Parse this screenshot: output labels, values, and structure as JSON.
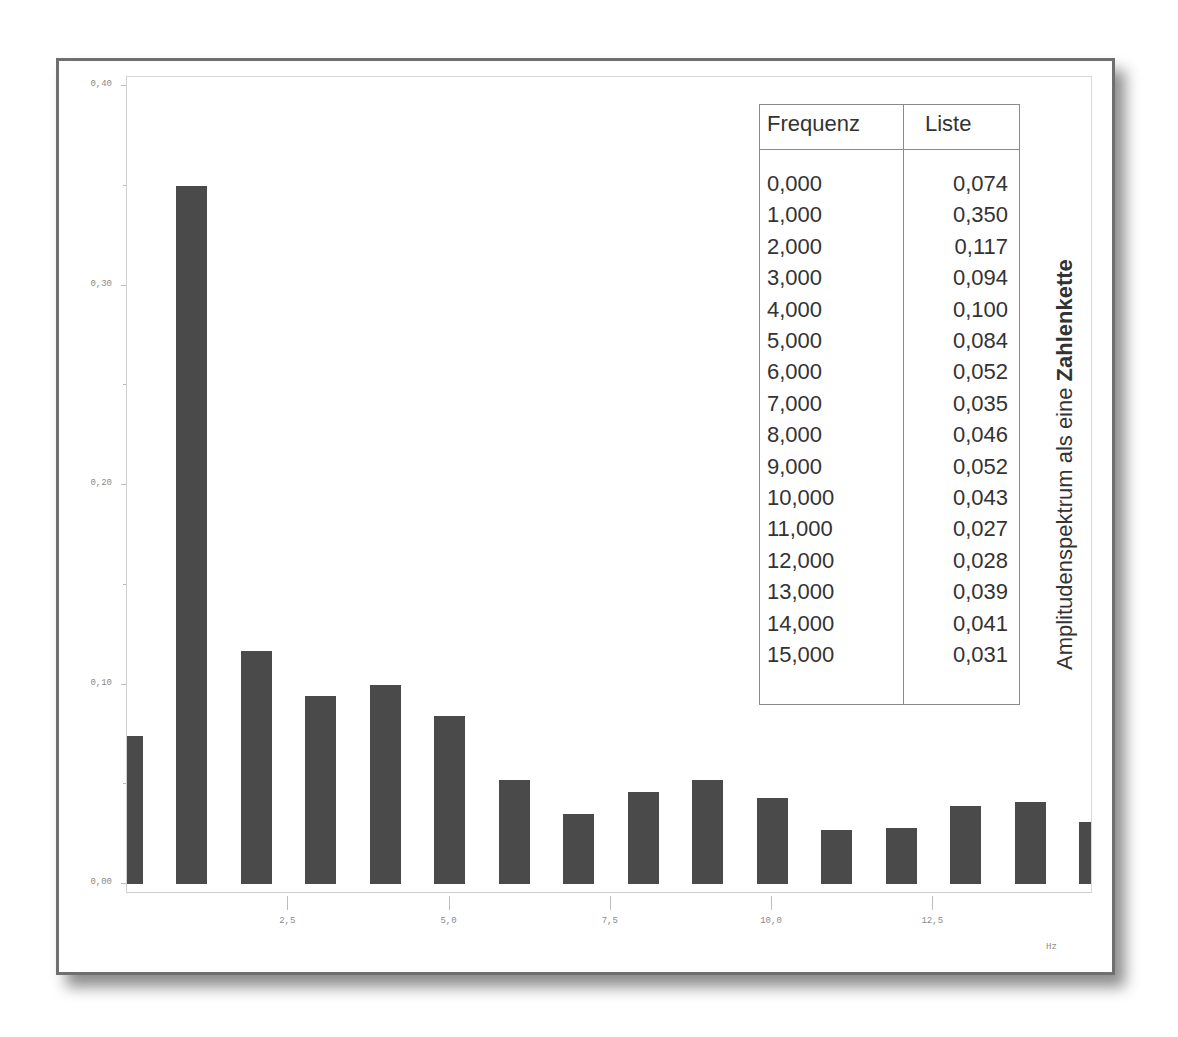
{
  "chart_data": {
    "type": "bar",
    "title": "Amplitudenspektrum als eine Zahlenkette",
    "xlabel": "Hz",
    "ylabel": "",
    "x": [
      0,
      1,
      2,
      3,
      4,
      5,
      6,
      7,
      8,
      9,
      10,
      11,
      12,
      13,
      14,
      15
    ],
    "values": [
      0.074,
      0.35,
      0.117,
      0.094,
      0.1,
      0.084,
      0.052,
      0.035,
      0.046,
      0.052,
      0.043,
      0.027,
      0.028,
      0.039,
      0.041,
      0.031
    ],
    "xlim": [
      0,
      15
    ],
    "ylim": [
      0,
      0.41
    ],
    "x_ticks": [
      "2,5",
      "5,0",
      "7,5",
      "10,0",
      "12,5"
    ],
    "x_tick_values": [
      2.5,
      5.0,
      7.5,
      10.0,
      12.5
    ],
    "y_ticks": [
      "0,00",
      "0,10",
      "0,20",
      "0,30",
      "0,40"
    ],
    "y_tick_values": [
      0.0,
      0.1,
      0.2,
      0.3,
      0.4
    ],
    "grid": false,
    "bar_color": "#4a4a4a"
  },
  "table": {
    "headers": [
      "Frequenz",
      "Liste"
    ],
    "rows": [
      [
        "0,000",
        "0,074"
      ],
      [
        "1,000",
        "0,350"
      ],
      [
        "2,000",
        "0,117"
      ],
      [
        "3,000",
        "0,094"
      ],
      [
        "4,000",
        "0,100"
      ],
      [
        "5,000",
        "0,084"
      ],
      [
        "6,000",
        "0,052"
      ],
      [
        "7,000",
        "0,035"
      ],
      [
        "8,000",
        "0,046"
      ],
      [
        "9,000",
        "0,052"
      ],
      [
        "10,000",
        "0,043"
      ],
      [
        "11,000",
        "0,027"
      ],
      [
        "12,000",
        "0,028"
      ],
      [
        "13,000",
        "0,039"
      ],
      [
        "14,000",
        "0,041"
      ],
      [
        "15,000",
        "0,031"
      ]
    ]
  },
  "side_title": {
    "normal": "Amplitudenspektrum als eine ",
    "bold": "Zahlenkette"
  },
  "x_unit": "Hz"
}
